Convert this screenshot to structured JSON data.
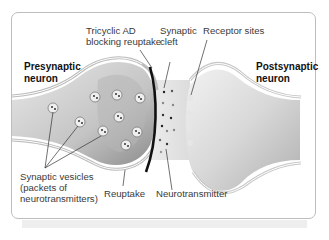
{
  "diagram": {
    "type": "synapse-illustration",
    "labels": {
      "presynaptic": "Presynaptic\nneuron",
      "postsynaptic": "Postsynaptic\nneuron",
      "tricyclic": "Tricyclic AD\nblocking reuptake",
      "cleft": "Synaptic\ncleft",
      "receptor": "Receptor sites",
      "vesicles": "Synaptic vesicles\n(packets of\nneurotransmitters)",
      "reuptake": "Reuptake",
      "neurotransmitter": "Neurotransmitter"
    },
    "colors": {
      "frame": "#bdbdbd",
      "neuron_fill": "#d6d6d6",
      "neuron_dark": "#9a9a9a",
      "blocker": "#111111",
      "text": "#3a3a3a"
    }
  }
}
